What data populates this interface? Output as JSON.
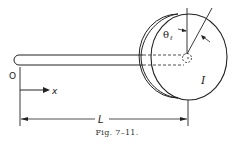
{
  "figure": {
    "caption": "Fig. 7–11.",
    "labels": {
      "origin": "O",
      "axis": "x",
      "length": "L",
      "angle": "θℓ",
      "inertia": "I"
    },
    "components": [
      "rod",
      "disc",
      "hub",
      "angle-indicator",
      "length-dimension",
      "x-axis-arrow"
    ]
  }
}
